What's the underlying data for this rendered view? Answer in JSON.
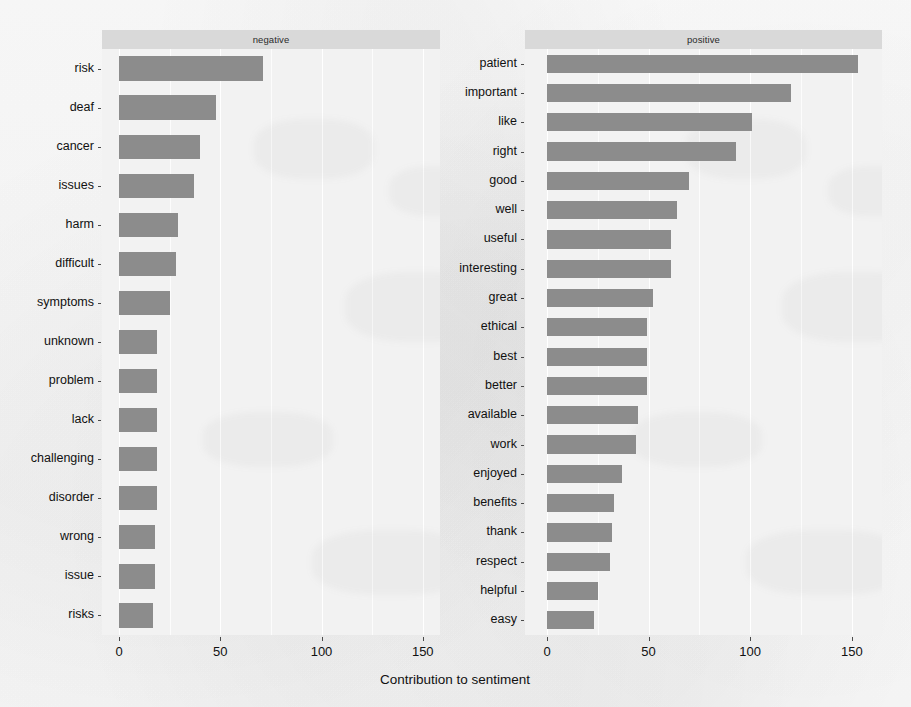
{
  "chart_data": {
    "type": "bar",
    "title": "",
    "xlabel": "Contribution to sentiment",
    "ylabel": "",
    "orientation": "horizontal",
    "xlim": [
      0,
      165
    ],
    "xticks": [
      0,
      50,
      100,
      150
    ],
    "xtick_labels": [
      "0",
      "50",
      "100",
      "150"
    ],
    "grid": true,
    "legend": "none",
    "bar_color": "#8c8c8c",
    "panel_background": "#f2f2f2",
    "strip_background": "#d9d9d9",
    "facets": [
      {
        "label": "negative",
        "categories": [
          "risk",
          "deaf",
          "cancer",
          "issues",
          "harm",
          "difficult",
          "symptoms",
          "unknown",
          "problem",
          "lack",
          "challenging",
          "disorder",
          "wrong",
          "issue",
          "risks"
        ],
        "values": [
          71,
          48,
          40,
          37,
          29,
          28,
          25,
          19,
          19,
          19,
          19,
          19,
          18,
          18,
          17
        ]
      },
      {
        "label": "positive",
        "categories": [
          "patient",
          "important",
          "like",
          "right",
          "good",
          "well",
          "useful",
          "interesting",
          "great",
          "ethical",
          "best",
          "better",
          "available",
          "work",
          "enjoyed",
          "benefits",
          "thank",
          "respect",
          "helpful",
          "easy"
        ],
        "values": [
          153,
          120,
          101,
          93,
          70,
          64,
          61,
          61,
          52,
          49,
          49,
          49,
          45,
          44,
          37,
          33,
          32,
          31,
          25,
          23
        ]
      }
    ]
  }
}
